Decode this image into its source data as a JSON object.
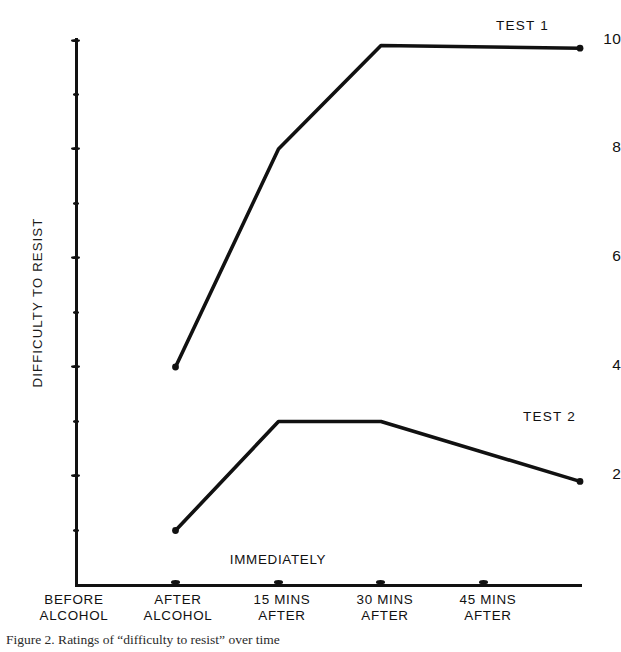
{
  "figure": {
    "caption": "Figure 2.  Ratings of “difficulty to resist” over time"
  },
  "chart_data": {
    "type": "line",
    "title": "",
    "xlabel": "",
    "ylabel": "DIFFICULTY TO RESIST",
    "categories": [
      "BEFORE ALCOHOL",
      "AFTER ALCOHOL",
      "15 MINS AFTER",
      "30 MINS AFTER",
      "45 MINS AFTER"
    ],
    "category_lines": [
      [
        "BEFORE",
        "ALCOHOL"
      ],
      [
        "AFTER",
        "ALCOHOL"
      ],
      [
        "15 MINS",
        "AFTER"
      ],
      [
        "30 MINS",
        "AFTER"
      ],
      [
        "45 MINS",
        "AFTER"
      ]
    ],
    "ylim": [
      0,
      10
    ],
    "ytick_values": [
      10,
      9,
      8,
      7,
      6,
      5,
      4,
      3,
      2,
      1
    ],
    "ytick_labels": [
      "10",
      "",
      "8",
      "",
      "6",
      "",
      "4",
      "",
      "2",
      ""
    ],
    "grid": false,
    "legend_position": "inline-right",
    "annotations": [
      {
        "text": "IMMEDIATELY",
        "at_category": "AFTER ALCOHOL",
        "position": "above-axis"
      }
    ],
    "series": [
      {
        "name": "TEST 1",
        "color": "#111111",
        "x": [
          "AFTER ALCOHOL",
          "15 MINS AFTER",
          "30 MINS AFTER",
          "45 MINS AFTER"
        ],
        "values": [
          4,
          8,
          9.9,
          9.85
        ]
      },
      {
        "name": "TEST 2",
        "color": "#111111",
        "x": [
          "AFTER ALCOHOL",
          "15 MINS AFTER",
          "30 MINS AFTER",
          "45 MINS AFTER"
        ],
        "values": [
          1,
          3,
          3,
          1.9
        ]
      }
    ]
  },
  "axis_label_numbers": {
    "t10": "10",
    "t8": "8",
    "t6": "6",
    "t4": "4",
    "t2": "2"
  },
  "series_labels": {
    "test1": "TEST 1",
    "test2": "TEST 2"
  },
  "annotation": {
    "immediately": "IMMEDIATELY"
  },
  "colors": {
    "ink": "#111111",
    "paper": "#ffffff"
  }
}
